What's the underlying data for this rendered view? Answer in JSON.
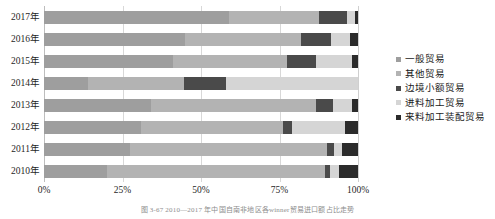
{
  "chart_data": {
    "type": "bar",
    "orientation": "horizontal",
    "stacked": true,
    "normalized": true,
    "title": "",
    "xlabel": "",
    "ylabel": "",
    "xlim": [
      0,
      100
    ],
    "grid": true,
    "legend_position": "right",
    "xticks": [
      "0%",
      "25%",
      "50%",
      "75%",
      "100%"
    ],
    "xtick_values": [
      0,
      25,
      50,
      75,
      100
    ],
    "categories": [
      "2017年",
      "2016年",
      "2015年",
      "2014年",
      "2013年",
      "2012年",
      "2011年",
      "2010年"
    ],
    "series": [
      {
        "name": "一般贸易",
        "color": "#9e9e9e",
        "values": [
          59.0,
          45.0,
          41.0,
          14.0,
          34.0,
          31.0,
          27.5,
          20.0
        ]
      },
      {
        "name": "其他贸易",
        "color": "#b3b3b3",
        "values": [
          28.5,
          37.0,
          36.5,
          30.5,
          52.5,
          45.0,
          62.5,
          69.5
        ]
      },
      {
        "name": "边境小额贸易",
        "color": "#4a4a4a",
        "values": [
          9.0,
          9.5,
          9.0,
          13.5,
          5.5,
          3.0,
          2.5,
          1.5
        ]
      },
      {
        "name": "进料加工贸易",
        "color": "#d5d5d5",
        "values": [
          2.5,
          6.0,
          11.5,
          42.0,
          6.0,
          17.0,
          2.5,
          3.0
        ]
      },
      {
        "name": "来料加工装配贸易",
        "color": "#2b2b2b",
        "values": [
          1.0,
          2.5,
          2.0,
          0.0,
          2.0,
          4.0,
          5.0,
          6.0
        ]
      }
    ]
  },
  "legend": {
    "items": [
      {
        "label": "一般贸易",
        "color": "#9e9e9e"
      },
      {
        "label": "其他贸易",
        "color": "#b3b3b3"
      },
      {
        "label": "边境小额贸易",
        "color": "#4a4a4a"
      },
      {
        "label": "进料加工贸易",
        "color": "#d5d5d5"
      },
      {
        "label": "来料加工装配贸易",
        "color": "#2b2b2b"
      }
    ]
  },
  "caption": {
    "text": "图 3-67   2010—2017 年中国自南非地区各winner贸易进口额占比走势"
  }
}
